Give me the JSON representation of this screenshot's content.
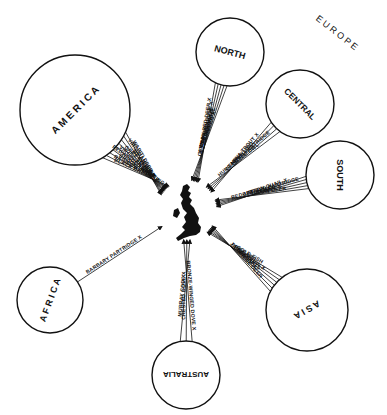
{
  "diagram": {
    "target": {
      "name": "Great Britain",
      "cx": 187,
      "cy": 210
    },
    "group_labels": [
      {
        "text": "E U R O P E",
        "x": 335,
        "y": 35,
        "rotate": 38
      }
    ],
    "regions": [
      {
        "id": "america",
        "label": "A M E R I C A",
        "cx": 75,
        "cy": 110,
        "r": 55,
        "label_rotate": -45,
        "font_size": 10,
        "species": [
          "WAPITI DEER X",
          "VIRGINIAN DEER X",
          "BEAVER X",
          "GREY SQUIRREL",
          "VIRGINIAN QUAIL X",
          "REDWINGED STARLING",
          "BROOK TROUT",
          "RAINBOW TROUT",
          "BLACK BASS X"
        ]
      },
      {
        "id": "europe-north",
        "label": "NORTH",
        "cx": 230,
        "cy": 52,
        "r": 34,
        "label_rotate": 15,
        "font_size": 9,
        "species": [
          "REINDEER X",
          "RED SQUIRREL",
          "CAPERCAILLIE",
          "WILLOW GROUSE X",
          "GERMAN RED DEER X"
        ]
      },
      {
        "id": "europe-central",
        "label": "CENTRAL",
        "cx": 300,
        "cy": 104,
        "r": 34,
        "label_rotate": 45,
        "font_size": 8.5,
        "species": [
          "LITTLE OWL",
          "HUNGARIAN PARTRIDGE",
          "GRAYLING",
          "GENEVA TROUT X"
        ]
      },
      {
        "id": "europe-south",
        "label": "SOUTH",
        "cx": 340,
        "cy": 175,
        "r": 34,
        "label_rotate": 90,
        "font_size": 9,
        "species": [
          "FALLOW DEER",
          "RABBIT",
          "BUSTARD X",
          "RED-LEGGED PARTRIDGE",
          "BUTTON QUAIL X"
        ]
      },
      {
        "id": "asia",
        "label": "A S I A",
        "cx": 307,
        "cy": 310,
        "r": 41,
        "label_rotate": 150,
        "font_size": 9,
        "species": [
          "JAPANESE DEER",
          "PEACOCK",
          "PHEASANTS",
          "PEKIN ROBIN X",
          "CARP",
          "GOLD FISH"
        ]
      },
      {
        "id": "australia",
        "label": "AUSTRALIA",
        "cx": 186,
        "cy": 375,
        "r": 34,
        "label_rotate": 180,
        "font_size": 8,
        "species": [
          "MURRAY COD X",
          "CRESTED DOVE X",
          "BRONZE-WINGED DOVE X"
        ]
      },
      {
        "id": "africa",
        "label": "A F R I C A",
        "cx": 50,
        "cy": 300,
        "r": 33,
        "label_rotate": -70,
        "font_size": 9,
        "species": [
          "BARBARY PARTRIDGE X"
        ]
      }
    ]
  }
}
